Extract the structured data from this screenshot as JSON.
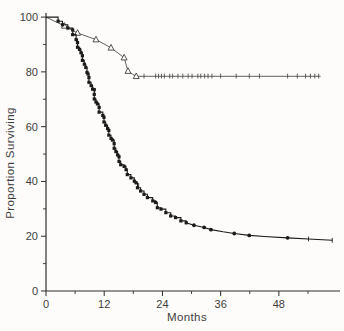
{
  "figure": {
    "background": "#fdfcfa",
    "axis_color": "#2e2e2e",
    "upper_line_color": "#4e4e4e",
    "lower_line_color": "#1b1b1b",
    "label_color": "#3d3d3d"
  },
  "chart_data": {
    "type": "line",
    "subtype": "kaplan-meier-survival",
    "title": "",
    "xlabel": "Months",
    "ylabel": "Proportion Surviving",
    "xlim": [
      0,
      60.6
    ],
    "ylim": [
      0,
      101.5
    ],
    "x_major_ticks": [
      0,
      12,
      24,
      36,
      48
    ],
    "x_minor_ticks": [
      6,
      18,
      30,
      42,
      54
    ],
    "y_major_ticks": [
      0,
      20,
      40,
      60,
      80,
      100
    ],
    "y_minor_ticks": [
      10,
      30,
      50,
      70,
      90
    ],
    "grid": false,
    "legend": "none",
    "series": [
      {
        "name": "upper-curve-open-triangles",
        "marker": "open-triangle",
        "plateau_value": 78.4,
        "plateau_end_month": 56.6,
        "points": [
          [
            0,
            100
          ],
          [
            3.8,
            96.8
          ],
          [
            6.5,
            94.2
          ],
          [
            10.3,
            91.8
          ],
          [
            13.4,
            88.8
          ],
          [
            16.1,
            85.2
          ],
          [
            16.9,
            80.3
          ],
          [
            17.8,
            79.2
          ],
          [
            18.6,
            78.4
          ],
          [
            56.6,
            78.4
          ]
        ],
        "marker_points": [
          [
            3.8,
            96.8
          ],
          [
            6.5,
            94.2
          ],
          [
            10.3,
            91.8
          ],
          [
            13.4,
            88.8
          ],
          [
            16.1,
            85.2
          ],
          [
            16.9,
            80.3
          ],
          [
            18.6,
            78.4
          ]
        ],
        "censor_tick_months": [
          20.2,
          22.6,
          23.2,
          23.8,
          24.4,
          25.5,
          26.1,
          27.2,
          28.2,
          29.3,
          30.1,
          31.3,
          31.9,
          32.7,
          33.4,
          34.2,
          36.0,
          39.2,
          41.9,
          44.0,
          49.8,
          51.8,
          53.5,
          54.5,
          55.4,
          56.2
        ],
        "censor_tick_value": 78.4
      },
      {
        "name": "lower-curve-filled-squares",
        "marker": "filled-square",
        "final_value": 18.5,
        "final_month": 59.0,
        "step_points": [
          [
            0,
            100
          ],
          [
            2.5,
            98.5
          ],
          [
            3.4,
            97.2
          ],
          [
            4.5,
            96
          ],
          [
            5.5,
            93.6
          ],
          [
            6.2,
            91.8
          ],
          [
            6.5,
            89
          ],
          [
            6.9,
            88.2
          ],
          [
            7.2,
            87
          ],
          [
            7.5,
            84.2
          ],
          [
            7.9,
            82.8
          ],
          [
            8.2,
            81.6
          ],
          [
            8.45,
            79.8
          ],
          [
            8.65,
            79.2
          ],
          [
            8.85,
            76.2
          ],
          [
            9.3,
            75
          ],
          [
            9.6,
            73.7
          ],
          [
            9.95,
            70.1
          ],
          [
            10.3,
            69
          ],
          [
            10.6,
            68.3
          ],
          [
            10.95,
            65.3
          ],
          [
            11.7,
            64.1
          ],
          [
            11.95,
            61.7
          ],
          [
            12.3,
            60.5
          ],
          [
            12.7,
            59.3
          ],
          [
            12.95,
            56.9
          ],
          [
            13.4,
            55.7
          ],
          [
            13.7,
            55.1
          ],
          [
            14.05,
            52.1
          ],
          [
            14.4,
            50.9
          ],
          [
            14.75,
            49.7
          ],
          [
            15.05,
            47.3
          ],
          [
            15.4,
            46.1
          ],
          [
            16.1,
            45.5
          ],
          [
            16.5,
            44.3
          ],
          [
            16.75,
            42.5
          ],
          [
            17.5,
            41.3
          ],
          [
            18.2,
            40.1
          ],
          [
            18.55,
            39.5
          ],
          [
            18.85,
            37.7
          ],
          [
            19.5,
            36.5
          ],
          [
            20.2,
            35.3
          ],
          [
            20.9,
            34.1
          ],
          [
            22,
            32.9
          ],
          [
            22.6,
            32.3
          ],
          [
            22.95,
            30.4
          ],
          [
            23.7,
            29.9
          ],
          [
            24.7,
            28.6
          ],
          [
            25.7,
            27.4
          ],
          [
            26.7,
            26.8
          ],
          [
            27.8,
            25.6
          ],
          [
            28.9,
            24.9
          ]
        ],
        "tail_points": [
          [
            30.5,
            24
          ],
          [
            32.6,
            23.2
          ],
          [
            34,
            22.4
          ],
          [
            36.5,
            21.6
          ],
          [
            38.8,
            21
          ],
          [
            41.9,
            20.3
          ],
          [
            45,
            19.9
          ],
          [
            49.8,
            19.4
          ],
          [
            54.1,
            19
          ],
          [
            59,
            18.5
          ]
        ],
        "tail_marker_points": [
          [
            30.5,
            24
          ],
          [
            32.6,
            23.2
          ],
          [
            34,
            22.4
          ],
          [
            38.8,
            21
          ],
          [
            41.9,
            20.3
          ],
          [
            49.8,
            19.4
          ]
        ],
        "censor_ticks": [
          [
            19.1,
            38.5
          ],
          [
            54.1,
            19.0
          ],
          [
            59.0,
            18.5
          ]
        ]
      }
    ]
  }
}
